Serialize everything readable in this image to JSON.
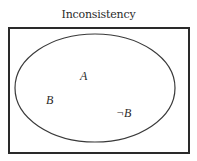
{
  "title": "Inconsistency",
  "diagram": {
    "universe": {
      "x": 9,
      "y": 28,
      "width": 180,
      "height": 125,
      "stroke": "#2a2a2a"
    },
    "set": {
      "cx": 95,
      "cy": 88,
      "rx": 80,
      "ry": 54,
      "stroke": "#3a3a3a"
    },
    "labels": [
      {
        "text": "A",
        "x": 80,
        "y": 80
      },
      {
        "text": "B",
        "x": 46,
        "y": 104
      },
      {
        "text": "¬B",
        "x": 116,
        "y": 117
      }
    ]
  }
}
